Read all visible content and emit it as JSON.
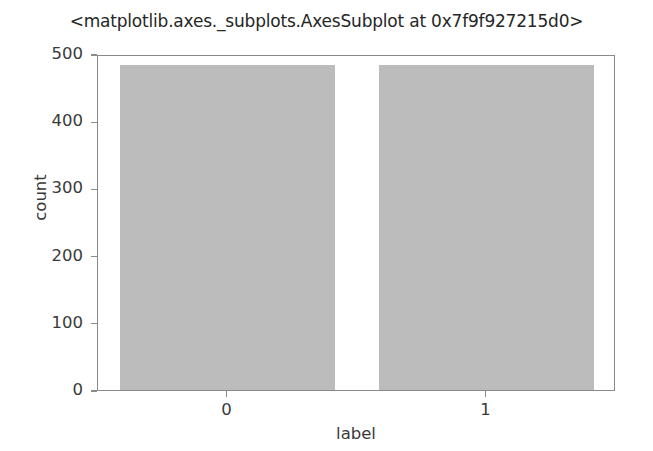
{
  "chart_data": {
    "type": "bar",
    "title": "<matplotlib.axes._subplots.AxesSubplot at 0x7f9f927215d0>",
    "xlabel": "label",
    "ylabel": "count",
    "categories": [
      "0",
      "1"
    ],
    "values": [
      484,
      484
    ],
    "series": [
      {
        "name": "count",
        "values": [
          484,
          484
        ]
      }
    ],
    "ylim": [
      0,
      500
    ],
    "yticks": [
      0,
      100,
      200,
      300,
      400,
      500
    ],
    "ytick_labels": [
      "0",
      "100",
      "200",
      "300",
      "400",
      "500"
    ],
    "xticks": [
      0,
      1
    ],
    "xtick_labels": [
      "0",
      "1"
    ],
    "grid": false,
    "legend": false,
    "legend_position": "none",
    "bar_color": "#bcbcbc",
    "axis_color": "#8a8a8a",
    "text_color": "#3a3a3a",
    "background_color": "#ffffff"
  }
}
